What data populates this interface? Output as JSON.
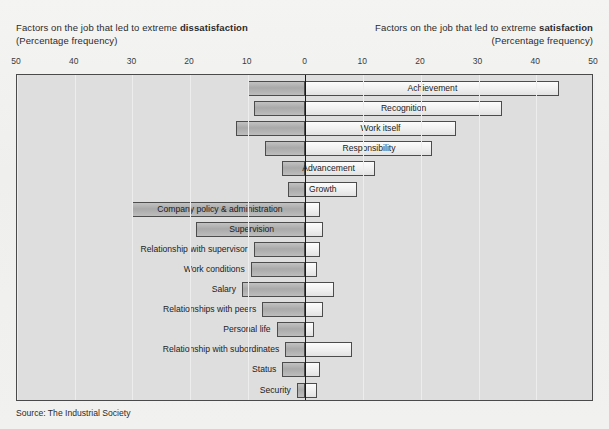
{
  "headers": {
    "left_line1_pre": "Factors on the job that led to extreme ",
    "left_line1_bold": "dissatisfaction",
    "left_line2": "(Percentage frequency)",
    "right_line1_pre": "Factors on the job that led to extreme ",
    "right_line1_bold": "satisfaction",
    "right_line2": "(Percentage frequency)"
  },
  "source": "Source: The Industrial Society",
  "colors": {
    "plot_background": "#dedede",
    "negative_bar": "#b0b0b0",
    "positive_bar": "#f0f0f0",
    "bar_border": "#4c4c4c",
    "zero_line": "#1a1a1a",
    "gridline": "#ededed",
    "text": "#1c1c1c"
  },
  "chart_data": {
    "type": "bar",
    "orientation": "horizontal-diverging",
    "title": "",
    "subtitle": "",
    "xlabel": "Percentage frequency",
    "ylabel": "",
    "xlim": [
      -50,
      50
    ],
    "xticks": [
      -50,
      -40,
      -30,
      -20,
      -10,
      0,
      10,
      20,
      30,
      40,
      50
    ],
    "xticklabels": [
      "50",
      "40",
      "30",
      "20",
      "10",
      "0",
      "10",
      "20",
      "30",
      "40",
      "50"
    ],
    "grid": true,
    "legend": null,
    "series": [
      {
        "name": "Dissatisfaction (left)",
        "note": "values plotted to the left of zero"
      },
      {
        "name": "Satisfaction (right)",
        "note": "values plotted to the right of zero"
      }
    ],
    "categories": [
      "Achievement",
      "Recognition",
      "Work itself",
      "Responsibility",
      "Advancement",
      "Growth",
      "Company policy & administration",
      "Supervision",
      "Relationship with supervisor",
      "Work conditions",
      "Salary",
      "Relationships with peers",
      "Personal life",
      "Relationship with subordinates",
      "Status",
      "Security"
    ],
    "items": [
      {
        "label": "Achievement",
        "dissatisfaction": 10.0,
        "satisfaction": 44.0,
        "label_pos": "inside-positive"
      },
      {
        "label": "Recognition",
        "dissatisfaction": 9.0,
        "satisfaction": 34.0,
        "label_pos": "inside-positive"
      },
      {
        "label": "Work itself",
        "dissatisfaction": 12.0,
        "satisfaction": 26.0,
        "label_pos": "inside-positive"
      },
      {
        "label": "Responsibility",
        "dissatisfaction": 7.0,
        "satisfaction": 22.0,
        "label_pos": "inside-positive"
      },
      {
        "label": "Advancement",
        "dissatisfaction": 4.0,
        "satisfaction": 12.0,
        "label_pos": "inside-centered"
      },
      {
        "label": "Growth",
        "dissatisfaction": 3.0,
        "satisfaction": 9.0,
        "label_pos": "inside-centered"
      },
      {
        "label": "Company policy & administration",
        "dissatisfaction": 30.0,
        "satisfaction": 2.5,
        "label_pos": "inside-negative"
      },
      {
        "label": "Supervision",
        "dissatisfaction": 19.0,
        "satisfaction": 3.0,
        "label_pos": "inside-negative"
      },
      {
        "label": "Relationship with supervisor",
        "dissatisfaction": 9.0,
        "satisfaction": 2.5,
        "label_pos": "outside-left"
      },
      {
        "label": "Work conditions",
        "dissatisfaction": 9.5,
        "satisfaction": 2.0,
        "label_pos": "outside-left"
      },
      {
        "label": "Salary",
        "dissatisfaction": 11.0,
        "satisfaction": 5.0,
        "label_pos": "outside-left"
      },
      {
        "label": "Relationships with peers",
        "dissatisfaction": 7.5,
        "satisfaction": 3.0,
        "label_pos": "outside-left"
      },
      {
        "label": "Personal life",
        "dissatisfaction": 5.0,
        "satisfaction": 1.5,
        "label_pos": "outside-left"
      },
      {
        "label": "Relationship with subordinates",
        "dissatisfaction": 3.5,
        "satisfaction": 8.0,
        "label_pos": "outside-left"
      },
      {
        "label": "Status",
        "dissatisfaction": 4.0,
        "satisfaction": 2.5,
        "label_pos": "outside-left"
      },
      {
        "label": "Security",
        "dissatisfaction": 1.5,
        "satisfaction": 2.0,
        "label_pos": "outside-left"
      }
    ]
  }
}
